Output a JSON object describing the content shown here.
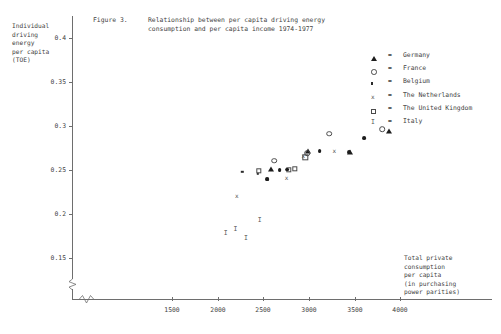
{
  "figure": {
    "title_number": "Figure 3.",
    "title_line1": "Relationship between per capita driving energy",
    "title_line2": "consumption and per capita income 1974-1977",
    "y_axis_caption": "Individual\ndriving\nenergy\nper capita\n(TOE)",
    "x_axis_caption": "Total private\nconsumption\nper capita\n(in purchasing\npower parities)"
  },
  "legend": {
    "equals": "=",
    "items": [
      {
        "marker": "filled-triangle-icon",
        "label": "Germany"
      },
      {
        "marker": "open-circle-icon",
        "label": "France"
      },
      {
        "marker": "small-filled-square-icon",
        "label": "Belgium"
      },
      {
        "marker": "cross-x-icon",
        "label": "The Netherlands"
      },
      {
        "marker": "open-square-icon",
        "label": "The United Kingdom"
      },
      {
        "marker": "letter-i-icon",
        "label": "Italy"
      }
    ]
  },
  "chart_data": {
    "type": "scatter",
    "xlabel": "Total private consumption per capita (in purchasing power parities)",
    "ylabel": "Individual driving energy per capita (TOE)",
    "xlim": [
      1150,
      4450
    ],
    "ylim": [
      0.135,
      0.41
    ],
    "xticks": [
      1500,
      2000,
      2500,
      3000,
      3500,
      4000
    ],
    "yticks": [
      0.4,
      0.35,
      0.3,
      0.25,
      0.2,
      0.15
    ],
    "grid": false,
    "axis_break_x": true,
    "axis_break_y": true,
    "legend_position": "upper-right",
    "series": [
      {
        "name": "Germany",
        "marker": "filled-triangle",
        "points": [
          [
            2590,
            0.2515
          ],
          [
            2990,
            0.2715
          ],
          [
            3450,
            0.2705
          ],
          [
            3880,
            0.2945
          ]
        ]
      },
      {
        "name": "France",
        "marker": "open-circle",
        "points": [
          [
            2620,
            0.2605
          ],
          [
            2985,
            0.269
          ],
          [
            3225,
            0.291
          ],
          [
            3805,
            0.2965
          ]
        ]
      },
      {
        "name": "Belgium",
        "marker": "small-filled-square",
        "points": [
          [
            2270,
            0.248
          ],
          [
            2440,
            0.2455
          ],
          [
            2680,
            0.25
          ],
          [
            2545,
            0.2395
          ]
        ]
      },
      {
        "name": "The Netherlands",
        "marker": "cross-x",
        "points": [
          [
            2210,
            0.22
          ],
          [
            2940,
            0.266
          ],
          [
            3280,
            0.272
          ],
          [
            2755,
            0.2415
          ]
        ]
      },
      {
        "name": "The United Kingdom",
        "marker": "open-square",
        "points": [
          [
            2780,
            0.2505
          ],
          [
            2960,
            0.2645
          ],
          [
            2455,
            0.249
          ],
          [
            2850,
            0.251
          ]
        ]
      },
      {
        "name": "Italy",
        "marker": "letter-i",
        "points": [
          [
            2090,
            0.179
          ],
          [
            2195,
            0.1835
          ],
          [
            2310,
            0.1725
          ],
          [
            2460,
            0.193
          ]
        ]
      }
    ],
    "filled_dots": [
      [
        2545,
        0.2395
      ],
      [
        2680,
        0.25
      ],
      [
        2760,
        0.2505
      ],
      [
        3120,
        0.2715
      ],
      [
        3440,
        0.2705
      ],
      [
        3610,
        0.2865
      ]
    ]
  }
}
